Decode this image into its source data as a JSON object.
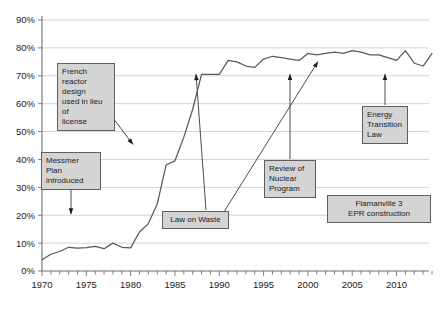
{
  "chart_data": {
    "type": "line",
    "title": "",
    "subtitle": "",
    "xlabel": "",
    "ylabel": "",
    "xlim": [
      1970,
      2014
    ],
    "ylim": [
      0,
      0.9
    ],
    "grid": true,
    "legend": "none",
    "y_tick_labels": [
      "0%",
      "10%",
      "20%",
      "30%",
      "40%",
      "50%",
      "60%",
      "70%",
      "80%",
      "90%"
    ],
    "y_tick_values": [
      0,
      10,
      20,
      30,
      40,
      50,
      60,
      70,
      80,
      90
    ],
    "x_tick_labels": [
      "1970",
      "1975",
      "1980",
      "1985",
      "1990",
      "1995",
      "2000",
      "2005",
      "2010"
    ],
    "x_tick_values": [
      1970,
      1975,
      1980,
      1985,
      1990,
      1995,
      2000,
      2005,
      2010
    ],
    "x_minor_tick_step": 1,
    "series": [
      {
        "name": "Share of nuclear in electricity generation",
        "color": "#595959",
        "x": [
          1970,
          1971,
          1972,
          1973,
          1974,
          1975,
          1976,
          1977,
          1978,
          1979,
          1980,
          1981,
          1982,
          1983,
          1984,
          1985,
          1986,
          1987,
          1988,
          1989,
          1990,
          1991,
          1992,
          1993,
          1994,
          1995,
          1996,
          1997,
          1998,
          1999,
          2000,
          2001,
          2002,
          2003,
          2004,
          2005,
          2006,
          2007,
          2008,
          2009,
          2010,
          2011,
          2012,
          2013,
          2014
        ],
        "values": [
          4,
          6,
          7,
          8.5,
          8.2,
          8.4,
          8.8,
          8,
          10,
          8.5,
          8.3,
          14,
          17,
          24,
          38,
          39.5,
          48,
          58,
          70.5,
          70.5,
          70.5,
          75.5,
          75,
          73.5,
          73,
          76,
          77,
          76.5,
          76,
          75.5,
          78,
          77.5,
          78,
          78.5,
          78,
          79,
          78.5,
          77.5,
          77.5,
          76.5,
          75.5,
          79,
          74.5,
          73.5,
          78
        ]
      }
    ],
    "annotations": [
      {
        "id": "messmer-plan",
        "text": "Messmer Plan introduced",
        "lines": [
          "Messmer Plan",
          "introduced"
        ],
        "align": "left",
        "target_year": 1974,
        "target_value": 20
      },
      {
        "id": "french-reactor-design",
        "text": "French reactor design used in lieu of license",
        "lines": [
          "French",
          "reactor design",
          "used in lieu of",
          "license"
        ],
        "align": "left",
        "target_year": 1979,
        "target_value": 45
      },
      {
        "id": "law-on-waste",
        "text": "Law on Waste",
        "lines": [
          "Law on Waste"
        ],
        "align": "center",
        "target_year": 1991,
        "target_value": 71
      },
      {
        "id": "review-of-nuclear-program",
        "text": "Review of Nuclear Program",
        "lines": [
          "Review of",
          "Nuclear",
          "Program"
        ],
        "align": "left",
        "target_year": 1999,
        "target_value": 71
      },
      {
        "id": "energy-transition-law",
        "text": "Energy Transition Law",
        "lines": [
          "Energy",
          "Transition",
          "Law"
        ],
        "align": "left",
        "target_year": 2012,
        "target_value": 71
      },
      {
        "id": "flamanville-3-epr",
        "text": "Flamanville 3 EPR construction",
        "lines": [
          "Flamanville 3",
          "EPR construction"
        ],
        "align": "center",
        "target_year": null,
        "target_value": null
      }
    ],
    "colors": {
      "line": "#595959",
      "grid": "#c9c9c9",
      "axis": "#6f6f6f",
      "annotation_fill": "#d4d4d4",
      "annotation_border": "#5f5f5f",
      "background": "#ffffff"
    }
  }
}
